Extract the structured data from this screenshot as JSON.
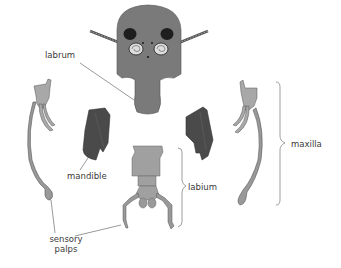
{
  "diagram": {
    "labels": {
      "labrum": "labrum",
      "mandible": "mandible",
      "labium": "labium",
      "maxilla": "maxilla",
      "sensory_palps_line1": "sensory",
      "sensory_palps_line2": "palps"
    },
    "colors": {
      "head": "#7a7a7a",
      "mandible": "#4a4a4a",
      "maxilla": "#a8a8a8",
      "labium": "#a0a0a0",
      "eye_dark": "#1e1e1e",
      "leader_line": "#555555",
      "background": "#ffffff"
    }
  }
}
